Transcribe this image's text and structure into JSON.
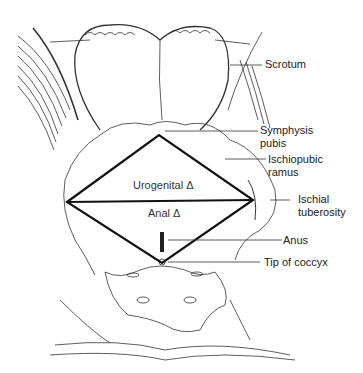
{
  "figure": {
    "labels": {
      "scrotum": "Scrotum",
      "symphysis_line1": "Symphysis",
      "symphysis_line2": "pubis",
      "ischiopubic_line1": "Ischiopubic",
      "ischiopubic_line2": "ramus",
      "ischial_line1": "Ischial",
      "ischial_line2": "tuberosity",
      "anus": "Anus",
      "coccyx": "Tip of coccyx"
    },
    "regions": {
      "urogenital": "Urogenital Δ",
      "anal": "Anal Δ"
    }
  }
}
